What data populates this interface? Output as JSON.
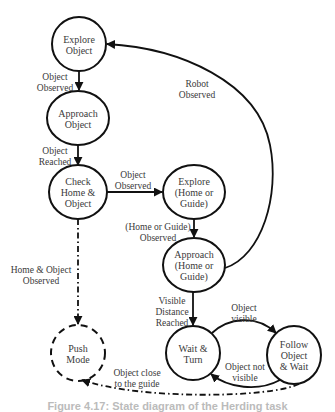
{
  "diagram": {
    "type": "state-machine",
    "nodes": [
      {
        "id": "explore_object",
        "label": "Explore\nObject",
        "style": "solid"
      },
      {
        "id": "approach_object",
        "label": "Approach\nObject",
        "style": "solid"
      },
      {
        "id": "check_home_object",
        "label": "Check\nHome &\nObject",
        "style": "solid"
      },
      {
        "id": "explore_home_guide",
        "label": "Explore\n(Home or\nGuide)",
        "style": "solid"
      },
      {
        "id": "approach_home_guide",
        "label": "Approach\n(Home or\nGuide)",
        "style": "solid"
      },
      {
        "id": "wait_turn",
        "label": "Wait &\nTurn",
        "style": "solid"
      },
      {
        "id": "follow_object_wait",
        "label": "Follow\nObject\n& Wait",
        "style": "solid"
      },
      {
        "id": "push_mode",
        "label": "Push\nMode",
        "style": "dashed"
      }
    ],
    "edges": [
      {
        "from": "explore_object",
        "to": "approach_object",
        "label": "Object\nObserved",
        "style": "solid"
      },
      {
        "from": "approach_object",
        "to": "check_home_object",
        "label": "Object\nReached",
        "style": "solid"
      },
      {
        "from": "check_home_object",
        "to": "explore_home_guide",
        "label": "Object\nObserved",
        "style": "solid"
      },
      {
        "from": "explore_home_guide",
        "to": "approach_home_guide",
        "label": "(Home or Guide)\nObserved",
        "style": "solid"
      },
      {
        "from": "approach_home_guide",
        "to": "explore_object",
        "label": "Robot\nObserved",
        "style": "solid"
      },
      {
        "from": "approach_home_guide",
        "to": "wait_turn",
        "label": "Visible\nDistance\nReached",
        "style": "solid"
      },
      {
        "from": "wait_turn",
        "to": "follow_object_wait",
        "label": "Object\nvisible",
        "style": "solid"
      },
      {
        "from": "follow_object_wait",
        "to": "wait_turn",
        "label": "Object not\nvisible",
        "style": "solid"
      },
      {
        "from": "check_home_object",
        "to": "push_mode",
        "label": "Home & Object\nObserved",
        "style": "dash-dot"
      },
      {
        "from": "follow_object_wait",
        "to": "push_mode",
        "label": "Object close\nto the guide",
        "style": "dash-dot"
      }
    ],
    "caption": "Figure 4.17: State diagram of the Herding task",
    "colors": {
      "stroke": "#111111",
      "text": "#3a3a3a",
      "background": "#ffffff"
    }
  }
}
